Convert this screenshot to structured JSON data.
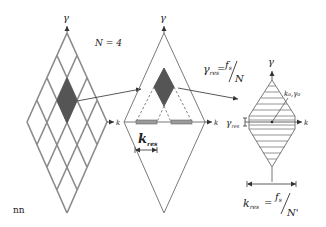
{
  "colors": {
    "line": "#7a7a7a",
    "dark_cell": "#555555",
    "bar_fill": "#9a9a9a",
    "text": "#222222"
  },
  "labels": {
    "gamma": "γ",
    "k": "k",
    "n_equals": "N = 4",
    "gamma_res": "γ",
    "gamma_res_sub": "res",
    "equals": "=",
    "fs": "f",
    "fs_sub": "s",
    "slash": "/",
    "N": "N",
    "N_prime": "N'",
    "k_res": "k",
    "k_res_sub": "res",
    "k0_gamma0": "k₀,γ₀",
    "gamma_res_side": "γ",
    "gamma_res_side_sub": "res",
    "footnote": "nn"
  },
  "panels": [
    {
      "name": "grid-diamond",
      "grid_n": 4,
      "highlight_cell": [
        0,
        1
      ]
    },
    {
      "name": "single-cell-diamond",
      "bars": 2
    },
    {
      "name": "resolution-diamond",
      "hatch_lines": 14
    }
  ]
}
